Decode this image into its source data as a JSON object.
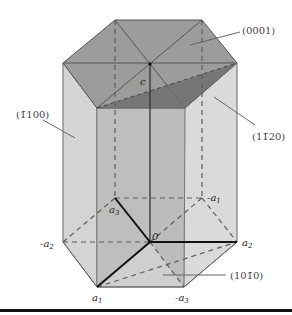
{
  "figure": {
    "planes": [
      {
        "id": "basal",
        "label": "(0001)"
      },
      {
        "id": "prism_m",
        "label": "(1̄1̄100)",
        "display": "(1̄100)"
      },
      {
        "id": "prism_a",
        "label": "(11̄20)"
      },
      {
        "id": "prism_m2",
        "label": "(101̄0)"
      }
    ],
    "plane_labels": {
      "basal": "(0001)",
      "left_prism": "(1̄100)",
      "right_prism": "(11̄20)",
      "bottom_prism": "(101̄0)"
    },
    "axis_labels": {
      "c": "c",
      "origin": "0",
      "a1": "a",
      "a1_sub": "1",
      "a2": "a",
      "a2_sub": "2",
      "a3": "a",
      "a3_sub": "3",
      "neg_a1": "-a",
      "neg_a1_sub": "1",
      "neg_a2": "-a",
      "neg_a2_sub": "2",
      "neg_a3": "-a",
      "neg_a3_sub": "3"
    },
    "colors": {
      "top_face": "#9a9a9a",
      "side_face": "#d2d2d2",
      "inner_plane": "#a8a8a8",
      "shaded_triangle": "#6e6e6e",
      "edge": "#555555",
      "axis": "#111111",
      "baseline": "#111111"
    }
  }
}
